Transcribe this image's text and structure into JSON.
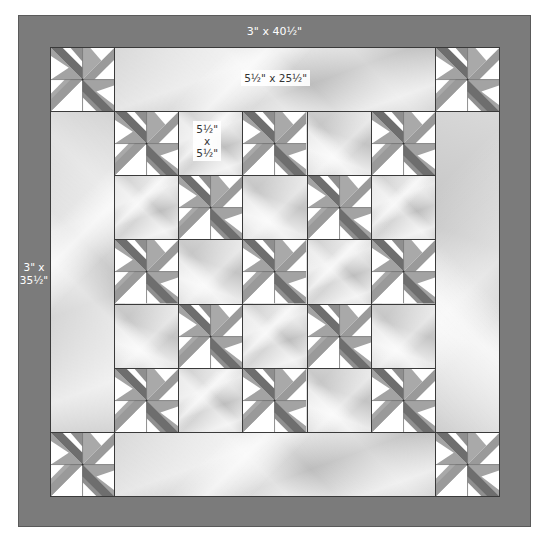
{
  "diagram": {
    "type": "quilt-layout",
    "colors": {
      "border": "#7b7b7b",
      "seam": "#3a3a3a",
      "star_dark": "#6e6e6e",
      "star_mid": "#8f8f8f",
      "star_light": "#a9a9a9",
      "star_background": "#ffffff",
      "label_text_on_border": "#ffffff",
      "label_text": "#333333"
    },
    "borders": {
      "top_bottom_label": "3\" x 40½\"",
      "side_label_line1": "3\" x",
      "side_label_line2": "35½\""
    },
    "panels": {
      "top_bottom_label": "5½\" x 25½\"",
      "square_label_line1": "5½\"",
      "square_label_line2": "x",
      "square_label_line3": "5½\""
    },
    "grid": {
      "rows": 7,
      "cols": 7,
      "layout": [
        [
          "star",
          "panel-h",
          "panel-h",
          "panel-h",
          "panel-h",
          "panel-h",
          "star"
        ],
        [
          "panel-v",
          "star",
          "square",
          "star",
          "square",
          "star",
          "panel-v"
        ],
        [
          "panel-v",
          "square",
          "star",
          "square",
          "star",
          "square",
          "panel-v"
        ],
        [
          "panel-v",
          "star",
          "square",
          "star",
          "square",
          "star",
          "panel-v"
        ],
        [
          "panel-v",
          "square",
          "star",
          "square",
          "star",
          "square",
          "panel-v"
        ],
        [
          "panel-v",
          "star",
          "square",
          "star",
          "square",
          "star",
          "panel-v"
        ],
        [
          "star",
          "panel-h",
          "panel-h",
          "panel-h",
          "panel-h",
          "panel-h",
          "star"
        ]
      ]
    }
  }
}
